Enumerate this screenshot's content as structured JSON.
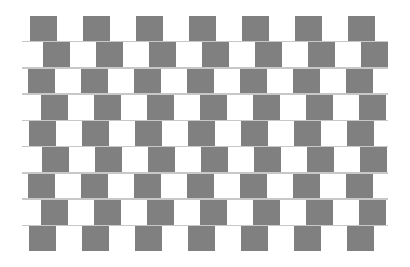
{
  "figure": {
    "name": "cafe-wall-illusion",
    "background_color": "#ffffff",
    "canvas": {
      "width": 410,
      "height": 267
    },
    "pattern_area": {
      "x": 22,
      "y": 16,
      "width": 366,
      "height": 235
    },
    "colors": {
      "dark_tile": "#808080",
      "light_tile": "#ffffff",
      "mortar_line": "#c8c8c8",
      "background": "#ffffff"
    },
    "geometry": {
      "rows": 9,
      "columns": 14,
      "tile_width": 26.5,
      "row_height": 24.5,
      "mortar_thickness": 1.6,
      "row_offsets": [
        8,
        21,
        6,
        19,
        7,
        20,
        6,
        19,
        7
      ]
    },
    "rows": [
      {
        "index": 1,
        "offset": 8,
        "first_tile": "light"
      },
      {
        "index": 2,
        "offset": 21,
        "first_tile": "light"
      },
      {
        "index": 3,
        "offset": 6,
        "first_tile": "light"
      },
      {
        "index": 4,
        "offset": 19,
        "first_tile": "light"
      },
      {
        "index": 5,
        "offset": 7,
        "first_tile": "light"
      },
      {
        "index": 6,
        "offset": 20,
        "first_tile": "light"
      },
      {
        "index": 7,
        "offset": 6,
        "first_tile": "light"
      },
      {
        "index": 8,
        "offset": 19,
        "first_tile": "light"
      },
      {
        "index": 9,
        "offset": 7,
        "first_tile": "light"
      }
    ]
  }
}
